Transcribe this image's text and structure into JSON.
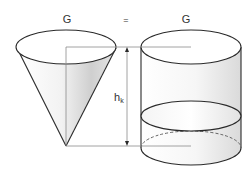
{
  "diagram": {
    "left_label": "G",
    "equals_sign": "=",
    "right_label": "G",
    "height_label_main": "h",
    "height_label_sub": "k",
    "left_shape": "cone",
    "right_shape": "cylinder",
    "colors": {
      "stroke": "#2a2a2a",
      "guide_line": "#8a8a8a",
      "fill_light": "#ffffff",
      "fill_shade": "#d4d4d4"
    }
  }
}
